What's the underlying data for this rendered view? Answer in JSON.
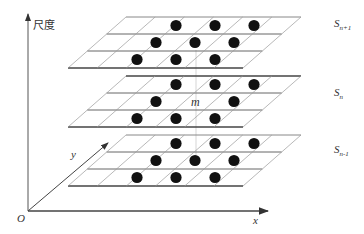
{
  "diagram": {
    "type": "multi-scale stacked grid (scale space neighborhood)",
    "axes": {
      "vertical_label": "尺度",
      "x_label": "x",
      "y_label": "y",
      "origin_label": "O"
    },
    "layers": [
      {
        "name": "S",
        "sub": "n+1",
        "position": "top"
      },
      {
        "name": "S",
        "sub": "n",
        "position": "middle"
      },
      {
        "name": "S",
        "sub": "n-1",
        "position": "bottom"
      }
    ],
    "center_point_label": "m",
    "colors": {
      "grid_line": "#9a9a9a",
      "layer_edge": "#444444",
      "dot": "#111111",
      "axis": "#444444"
    }
  }
}
